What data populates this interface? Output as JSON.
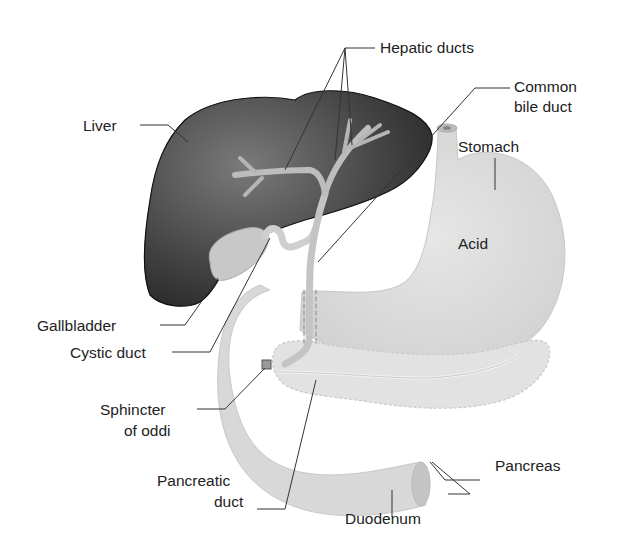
{
  "diagram": {
    "labels": {
      "hepatic_ducts": "Hepatic ducts",
      "common_bile_duct_1": "Common",
      "common_bile_duct_2": "bile duct",
      "liver": "Liver",
      "stomach": "Stomach",
      "acid": "Acid",
      "gallbladder": "Gallbladder",
      "cystic_duct": "Cystic duct",
      "sphincter_1": "Sphincter",
      "sphincter_2": "of oddi",
      "pancreas": "Pancreas",
      "pancreatic_duct_1": "Pancreatic",
      "pancreatic_duct_2": "duct",
      "duodenum": "Duodenum"
    },
    "colors": {
      "liver": "#3a3a3a",
      "organ_light": "#d6d6d6",
      "duct": "#b8b8b8",
      "leader": "#333333"
    }
  }
}
